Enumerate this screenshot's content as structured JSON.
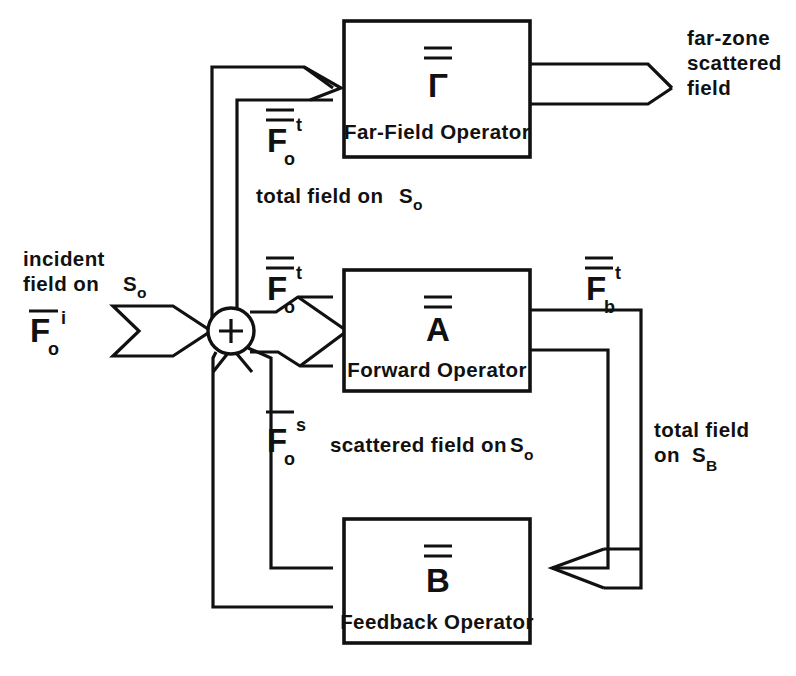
{
  "diagram": {
    "background_color": "#ffffff",
    "line_color": "#111111",
    "blocks": [
      {
        "id": "far_field",
        "symbol": "Γ",
        "symbol_overline": "double",
        "caption": "Far-Field Operator"
      },
      {
        "id": "forward",
        "symbol": "A",
        "symbol_overline": "double",
        "caption": "Forward Operator"
      },
      {
        "id": "feedback",
        "symbol": "B",
        "symbol_overline": "double",
        "caption": "Feedback Operator"
      }
    ],
    "junction": {
      "id": "summing_junction",
      "sign": "+"
    },
    "signals": {
      "incident": {
        "caption_line1": "incident",
        "caption_line2": "field on",
        "caption_line2_sub": "o",
        "caption_line2_symbol": "S",
        "symbol_base": "F",
        "symbol_overline": "single",
        "symbol_sub": "o",
        "symbol_sup": "i"
      },
      "total_field_top": {
        "symbol_base": "F",
        "symbol_overline": "double",
        "symbol_sub": "o",
        "symbol_sup": "t",
        "caption": "total field on",
        "caption_symbol": "S",
        "caption_sub": "o"
      },
      "total_field_mid": {
        "symbol_base": "F",
        "symbol_overline": "double",
        "symbol_sub": "o",
        "symbol_sup": "t"
      },
      "total_field_b": {
        "symbol_base": "F",
        "symbol_overline": "double",
        "symbol_sub": "b",
        "symbol_sup": "t",
        "caption_line1": "total field",
        "caption_line2": "on",
        "caption_symbol": "S",
        "caption_sub": "B"
      },
      "scattered_field": {
        "symbol_base": "F",
        "symbol_overline": "double",
        "symbol_sub": "o",
        "symbol_sup": "s",
        "caption": "scattered field on",
        "caption_symbol": "S",
        "caption_sub": "o"
      },
      "far_zone": {
        "caption_line1": "far-zone",
        "caption_line2": "scattered",
        "caption_line3": "field"
      }
    }
  }
}
